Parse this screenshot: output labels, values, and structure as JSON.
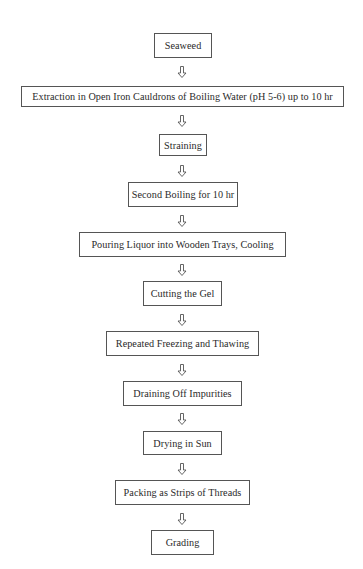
{
  "diagram": {
    "type": "flowchart",
    "direction": "top-to-bottom",
    "colors": {
      "background": "#ffffff",
      "border": "#555555",
      "text": "#2a2a2a",
      "arrow": "#555555"
    },
    "arrow_icon": "hollow-down-arrow-icon",
    "steps": [
      {
        "label": "Seaweed"
      },
      {
        "label": "Extraction in Open Iron Cauldrons of Boiling Water (pH 5-6) up to 10 hr"
      },
      {
        "label": "Straining"
      },
      {
        "label": "Second Boiling for 10 hr"
      },
      {
        "label": "Pouring Liquor into Wooden Trays, Cooling"
      },
      {
        "label": "Cutting the Gel"
      },
      {
        "label": "Repeated Freezing and Thawing"
      },
      {
        "label": "Draining Off Impurities"
      },
      {
        "label": "Drying in Sun"
      },
      {
        "label": "Packing as Strips of Threads"
      },
      {
        "label": "Grading"
      }
    ]
  }
}
